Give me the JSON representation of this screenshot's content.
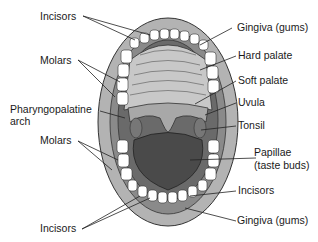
{
  "diagram": {
    "labels": {
      "incisors_top": "Incisors",
      "molars_top": "Molars",
      "pharyngopalatine_arch_1": "Pharyngopalatine",
      "pharyngopalatine_arch_2": "arch",
      "molars_bottom": "Molars",
      "incisors_bottom_left": "Incisors",
      "gingiva_top": "Gingiva (gums)",
      "hard_palate": "Hard palate",
      "soft_palate": "Soft palate",
      "uvula": "Uvula",
      "tonsil": "Tonsil",
      "papillae_1": "Papillae",
      "papillae_2": "(taste buds)",
      "incisors_bottom_right": "Incisors",
      "gingiva_bottom": "Gingiva (gums)"
    },
    "colors": {
      "lips": "#b3b3b3",
      "gums": "#8a8a8a",
      "palate": "#c8c8c8",
      "tongue": "#4a4a4a",
      "teeth": "#ffffff",
      "outline": "#333333"
    }
  }
}
